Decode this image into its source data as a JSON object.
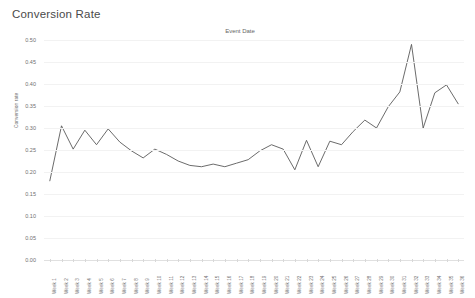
{
  "title": "Conversion Rate",
  "column_header": "Event Date",
  "axis": {
    "y_title": "Conversion rate",
    "y_ticks": [
      "0.50",
      "0.45",
      "0.40",
      "0.35",
      "0.30",
      "0.25",
      "0.20",
      "0.15",
      "0.10",
      "0.05",
      "0.00"
    ]
  },
  "style": {
    "line_color": "#5a5a5a",
    "grid_color": "#f2f2f2",
    "text_color": "#707070",
    "title_color": "#4a4a4a",
    "background": "#ffffff"
  },
  "chart_data": {
    "type": "line",
    "title": "Conversion Rate",
    "subtitle": "Event Date",
    "xlabel": "Event Date",
    "ylabel": "Conversion rate",
    "ylim": [
      0.0,
      0.5
    ],
    "ytick_step": 0.05,
    "grid": true,
    "legend": "none",
    "categories": [
      "Week 1",
      "Week 2",
      "Week 3",
      "Week 4",
      "Week 5",
      "Week 6",
      "Week 7",
      "Week 8",
      "Week 9",
      "Week 10",
      "Week 11",
      "Week 12",
      "Week 13",
      "Week 14",
      "Week 15",
      "Week 16",
      "Week 17",
      "Week 18",
      "Week 19",
      "Week 20",
      "Week 21",
      "Week 22",
      "Week 23",
      "Week 24",
      "Week 25",
      "Week 26",
      "Week 27",
      "Week 28",
      "Week 29",
      "Week 30",
      "Week 31",
      "Week 32",
      "Week 33",
      "Week 34",
      "Week 35",
      "Week 36"
    ],
    "series": [
      {
        "name": "Conversion rate",
        "values": [
          0.18,
          0.305,
          0.252,
          0.295,
          0.262,
          0.298,
          0.268,
          0.248,
          0.232,
          0.252,
          0.24,
          0.225,
          0.215,
          0.212,
          0.218,
          0.212,
          0.22,
          0.228,
          0.248,
          0.262,
          0.252,
          0.205,
          0.272,
          0.212,
          0.27,
          0.262,
          0.292,
          0.318,
          0.3,
          0.348,
          0.382,
          0.49,
          0.3,
          0.38,
          0.398,
          0.355
        ]
      }
    ]
  }
}
